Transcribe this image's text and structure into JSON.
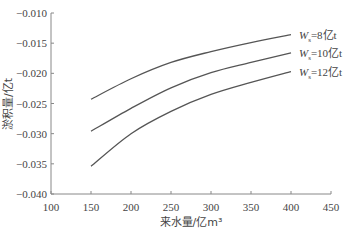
{
  "chart_data": {
    "type": "line",
    "title": "",
    "xlabel": "来水量/亿m³",
    "ylabel": "淤积量/亿t",
    "xlim": [
      100,
      450
    ],
    "ylim": [
      -0.04,
      -0.01
    ],
    "x_ticks": [
      100,
      150,
      200,
      250,
      300,
      350,
      400,
      450
    ],
    "x_tick_labels": [
      "100",
      "150",
      "200",
      "250",
      "300",
      "350",
      "400",
      "450"
    ],
    "y_ticks": [
      -0.01,
      -0.015,
      -0.02,
      -0.025,
      -0.03,
      -0.035,
      -0.04
    ],
    "y_tick_labels": [
      "-0.010",
      "-0.015",
      "-0.020",
      "-0.025",
      "-0.030",
      "-0.035",
      "-0.040"
    ],
    "grid": false,
    "legend": "inline labels at line ends (right)",
    "x": [
      150,
      200,
      250,
      300,
      350,
      400
    ],
    "series": [
      {
        "name": "Ws=8亿t",
        "label_main": "W",
        "label_sub": "s",
        "label_rest": "=8亿t",
        "values": [
          -0.0243,
          -0.0209,
          -0.0182,
          -0.0164,
          -0.0149,
          -0.0136
        ]
      },
      {
        "name": "Ws=10亿t",
        "label_main": "W",
        "label_sub": "s",
        "label_rest": "=10亿t",
        "values": [
          -0.0296,
          -0.0258,
          -0.0224,
          -0.0199,
          -0.0182,
          -0.0166
        ]
      },
      {
        "name": "Ws=12亿t",
        "label_main": "W",
        "label_sub": "s",
        "label_rest": "=12亿t",
        "values": [
          -0.0354,
          -0.03,
          -0.0263,
          -0.0235,
          -0.0215,
          -0.0197
        ]
      }
    ],
    "colors": {
      "line": "#555555",
      "axis": "#888888",
      "text": "#444444"
    }
  }
}
